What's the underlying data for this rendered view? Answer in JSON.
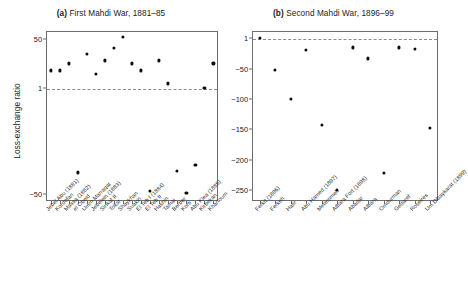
{
  "figure": {
    "ylabel": "Loss-exchange ratio"
  },
  "chart_data": [
    {
      "type": "scatter",
      "panel": "a",
      "tag": "(a)",
      "title": "First Mahdi War, 1881–85",
      "title_full": "(a) First Mahdi War, 1881–85",
      "xlabel": "",
      "ylabel": "Loss-exchange ratio",
      "yscale": "log",
      "yticks": [
        50,
        1,
        -50
      ],
      "yticklabels": [
        "50",
        "1",
        "−50"
      ],
      "ylim": [
        -90,
        95
      ],
      "reference_line": 1,
      "grid": false,
      "legend": null,
      "categories": [
        "Jebel Abu (1881)",
        "Kordofan",
        "Massa (1882)",
        "el Obeid",
        "Umm Marraqat",
        "Jebelein (1883)",
        "Sinkat II",
        "Tokar",
        "Shaykhan",
        "Suakin",
        "El Teb I (1884)",
        "El Teb II",
        "Hashin",
        "Tamai",
        "Berber",
        "Korti",
        "Abu Klea (1885)",
        "Kirbekan",
        "Khartoum"
      ],
      "values": [
        4,
        4,
        7,
        -9,
        15,
        3,
        9,
        25,
        60,
        7,
        4,
        -40,
        9,
        1.4,
        -8,
        -47,
        -5,
        1,
        7
      ]
    },
    {
      "type": "scatter",
      "panel": "b",
      "tag": "(b)",
      "title": "Second Mahdi War, 1896–99",
      "title_full": "(b) Second Mahdi War, 1896–99",
      "xlabel": "",
      "ylabel": "",
      "yscale": "linear",
      "yticks": [
        1,
        -50,
        -100,
        -150,
        -200,
        -250
      ],
      "yticklabels": [
        "1",
        "−50",
        "−100",
        "−150",
        "−200",
        "−250"
      ],
      "ylim": [
        -268,
        12
      ],
      "reference_line": 1,
      "grid": false,
      "legend": null,
      "categories": [
        "Ferkit (1896)",
        "Ferkeh",
        "Hafir",
        "Abu Hamed (1897)",
        "Metemmeh",
        "Atbara Fort (1898)",
        "Abadar",
        "Atbara",
        "Omdurman",
        "Gedaref",
        "Roseires",
        "Um Dibaykarat (1899)"
      ],
      "values": [
        0,
        -52,
        -100,
        -19,
        -143,
        -250,
        -15,
        -33,
        -222,
        -15,
        -17,
        -148
      ]
    }
  ]
}
